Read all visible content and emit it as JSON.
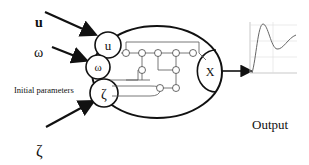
{
  "inputs": {
    "u": "u",
    "omega": "ω",
    "initial_label": "Initial parameters",
    "zeta": "ζ"
  },
  "model": {
    "inner_inputs": [
      "u",
      "ω",
      "ζ"
    ],
    "output_node": "X"
  },
  "output": {
    "label": "Output",
    "plot": "damped oscillation response"
  }
}
